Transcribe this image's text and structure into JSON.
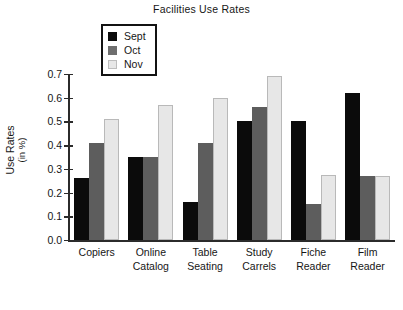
{
  "chart_data": {
    "type": "bar",
    "title": "Facilities Use Rates",
    "xlabel": "",
    "ylabel": "Use Rates",
    "ylabel_line2": "(in %)",
    "ylim": [
      0.0,
      0.7
    ],
    "grid": false,
    "legend_position": "top-left-inside",
    "ytick_labels": [
      "0.7",
      "0.6",
      "0.5",
      "0.4",
      "0.3",
      "0.2",
      "0.1",
      "0.0"
    ],
    "ytick_values": [
      0.7,
      0.6,
      0.5,
      0.4,
      0.3,
      0.2,
      0.1,
      0.0
    ],
    "categories": [
      "Copiers",
      "Online Catalog",
      "Table Seating",
      "Study Carrels",
      "Fiche Reader",
      "Film Reader"
    ],
    "category_lines": [
      [
        "Copiers",
        ""
      ],
      [
        "Online",
        "Catalog"
      ],
      [
        "Table",
        "Seating"
      ],
      [
        "Study",
        "Carrels"
      ],
      [
        "Fiche",
        "Reader"
      ],
      [
        "Film",
        "Reader"
      ]
    ],
    "series": [
      {
        "name": "Sept",
        "color": "#0b0b0b",
        "values": [
          0.26,
          0.35,
          0.16,
          0.5,
          0.5,
          0.62
        ]
      },
      {
        "name": "Oct",
        "color": "#5d5d5d",
        "values": [
          0.41,
          0.35,
          0.41,
          0.56,
          0.15,
          0.27
        ]
      },
      {
        "name": "Nov",
        "color": "#e7e7e7",
        "values": [
          0.51,
          0.57,
          0.6,
          0.69,
          0.275,
          0.27
        ]
      }
    ]
  },
  "legend": {
    "items": [
      {
        "label": "Sept"
      },
      {
        "label": "Oct"
      },
      {
        "label": "Nov"
      }
    ]
  }
}
